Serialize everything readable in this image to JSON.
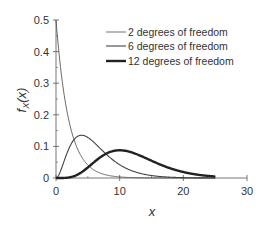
{
  "chart_data": {
    "type": "line",
    "title": "",
    "xlabel": "x",
    "ylabel": "f_X(x)",
    "xlim": [
      0,
      30
    ],
    "ylim": [
      0,
      0.5
    ],
    "x_ticks": [
      0,
      10,
      20,
      30
    ],
    "y_ticks": [
      0,
      0.1,
      0.2,
      0.3,
      0.4,
      0.5
    ],
    "x_tick_labels": [
      "0",
      "10",
      "20",
      "30"
    ],
    "y_tick_labels": [
      "0",
      "0.1",
      "0.2",
      "0.3",
      "0.4",
      "0.5"
    ],
    "grid": false,
    "legend_position": "upper right",
    "series": [
      {
        "name": "2 degrees of freedom",
        "dof": 2,
        "line_width": 0.8,
        "x_range": [
          0,
          25
        ],
        "sample_points": [
          [
            0,
            0.5
          ],
          [
            2,
            0.184
          ],
          [
            4,
            0.068
          ],
          [
            6,
            0.025
          ],
          [
            10,
            0.003
          ],
          [
            25,
            0.0
          ]
        ]
      },
      {
        "name": "6 degrees of freedom",
        "dof": 6,
        "line_width": 1.1,
        "x_range": [
          0,
          25
        ],
        "sample_points": [
          [
            0,
            0
          ],
          [
            2,
            0.092
          ],
          [
            4,
            0.135
          ],
          [
            6,
            0.112
          ],
          [
            10,
            0.042
          ],
          [
            15,
            0.007
          ],
          [
            25,
            0.0
          ]
        ]
      },
      {
        "name": "12 degrees of freedom",
        "dof": 12,
        "line_width": 2.4,
        "x_range": [
          0,
          25
        ],
        "sample_points": [
          [
            0,
            0
          ],
          [
            4,
            0.018
          ],
          [
            6,
            0.05
          ],
          [
            10,
            0.088
          ],
          [
            14,
            0.067
          ],
          [
            20,
            0.019
          ],
          [
            25,
            0.003
          ]
        ]
      }
    ]
  },
  "legend": [
    {
      "label": "2 degrees of freedom"
    },
    {
      "label": "6 degrees of freedom"
    },
    {
      "label": "12 degrees of freedom"
    }
  ],
  "axes": {
    "xlabel": "x",
    "ylabel_main": "f",
    "ylabel_sub": "X",
    "ylabel_arg": "(x)"
  }
}
